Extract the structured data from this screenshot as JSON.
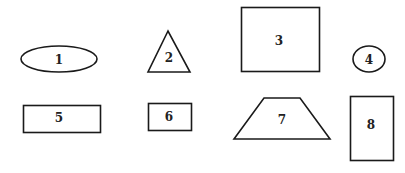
{
  "diagram": {
    "shapes": [
      {
        "id": "1",
        "type": "ellipse",
        "label": "1"
      },
      {
        "id": "2",
        "type": "triangle",
        "label": "2"
      },
      {
        "id": "3",
        "type": "rectangle",
        "label": "3"
      },
      {
        "id": "4",
        "type": "circle",
        "label": "4"
      },
      {
        "id": "5",
        "type": "rectangle",
        "label": "5"
      },
      {
        "id": "6",
        "type": "rectangle",
        "label": "6"
      },
      {
        "id": "7",
        "type": "trapezoid",
        "label": "7"
      },
      {
        "id": "8",
        "type": "rectangle",
        "label": "8"
      }
    ],
    "colors": {
      "stroke": "#1a1a1a",
      "fill": "#ffffff",
      "text": "#222222"
    }
  }
}
